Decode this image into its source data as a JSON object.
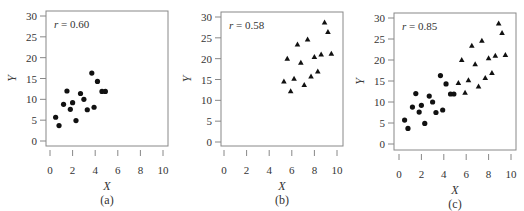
{
  "chart_data": [
    {
      "type": "scatter",
      "panel": "(a)",
      "annotation": "r = 0.60",
      "xlabel": "X",
      "ylabel": "Y",
      "xlim": [
        0,
        10
      ],
      "ylim": [
        0,
        30
      ],
      "xticks": [
        0,
        2,
        4,
        6,
        8,
        10
      ],
      "yticks": [
        0,
        5,
        10,
        15,
        20,
        25,
        30
      ],
      "marker": "circle",
      "points": [
        [
          0.5,
          5.7
        ],
        [
          0.8,
          3.7
        ],
        [
          1.2,
          8.8
        ],
        [
          1.5,
          12.0
        ],
        [
          1.8,
          7.6
        ],
        [
          2.0,
          9.2
        ],
        [
          2.3,
          4.9
        ],
        [
          2.7,
          11.4
        ],
        [
          3.0,
          10.0
        ],
        [
          3.3,
          7.5
        ],
        [
          3.7,
          16.3
        ],
        [
          3.9,
          8.1
        ],
        [
          4.2,
          14.3
        ],
        [
          4.6,
          11.9
        ],
        [
          4.9,
          11.9
        ]
      ]
    },
    {
      "type": "scatter",
      "panel": "(b)",
      "annotation": "r = 0.58",
      "xlabel": "X",
      "ylabel": "Y",
      "xlim": [
        0,
        10
      ],
      "ylim": [
        0,
        30
      ],
      "xticks": [
        0,
        2,
        4,
        6,
        8,
        10
      ],
      "yticks": [
        0,
        5,
        10,
        15,
        20,
        25,
        30
      ],
      "marker": "triangle",
      "points": [
        [
          5.3,
          14.5
        ],
        [
          5.6,
          20.0
        ],
        [
          5.9,
          12.2
        ],
        [
          6.2,
          15.2
        ],
        [
          6.5,
          23.4
        ],
        [
          6.8,
          19.0
        ],
        [
          7.1,
          13.7
        ],
        [
          7.4,
          24.6
        ],
        [
          7.7,
          15.7
        ],
        [
          8.0,
          20.4
        ],
        [
          8.3,
          16.9
        ],
        [
          8.6,
          21.0
        ],
        [
          8.9,
          28.7
        ],
        [
          9.2,
          26.4
        ],
        [
          9.5,
          21.2
        ]
      ]
    },
    {
      "type": "scatter",
      "panel": "(c)",
      "annotation": "r = 0.85",
      "xlabel": "X",
      "ylabel": "Y",
      "xlim": [
        0,
        10
      ],
      "ylim": [
        0,
        30
      ],
      "xticks": [
        0,
        2,
        4,
        6,
        8,
        10
      ],
      "yticks": [
        0,
        5,
        10,
        15,
        20,
        25,
        30
      ],
      "series": [
        {
          "name": "circles (a)",
          "marker": "circle",
          "points": [
            [
              0.5,
              5.7
            ],
            [
              0.8,
              3.7
            ],
            [
              1.2,
              8.8
            ],
            [
              1.5,
              12.0
            ],
            [
              1.8,
              7.6
            ],
            [
              2.0,
              9.2
            ],
            [
              2.3,
              4.9
            ],
            [
              2.7,
              11.4
            ],
            [
              3.0,
              10.0
            ],
            [
              3.3,
              7.5
            ],
            [
              3.7,
              16.3
            ],
            [
              3.9,
              8.1
            ],
            [
              4.2,
              14.3
            ],
            [
              4.6,
              11.9
            ],
            [
              4.9,
              11.9
            ]
          ]
        },
        {
          "name": "triangles (b)",
          "marker": "triangle",
          "points": [
            [
              5.3,
              14.5
            ],
            [
              5.6,
              20.0
            ],
            [
              5.9,
              12.2
            ],
            [
              6.2,
              15.2
            ],
            [
              6.5,
              23.4
            ],
            [
              6.8,
              19.0
            ],
            [
              7.1,
              13.7
            ],
            [
              7.4,
              24.6
            ],
            [
              7.7,
              15.7
            ],
            [
              8.0,
              20.4
            ],
            [
              8.3,
              16.9
            ],
            [
              8.6,
              21.0
            ],
            [
              8.9,
              28.7
            ],
            [
              9.2,
              26.4
            ],
            [
              9.5,
              21.2
            ]
          ]
        }
      ]
    }
  ],
  "layout": {
    "panels": [
      {
        "box": [
          46,
          11,
          168,
          146
        ],
        "x0": 50,
        "x10": 163,
        "y0": 141,
        "y30": 16
      },
      {
        "box": [
          221,
          12,
          343,
          146
        ],
        "x0": 224,
        "x10": 337,
        "y0": 142,
        "y30": 17
      },
      {
        "box": [
          394,
          13,
          516,
          150
        ],
        "x0": 399,
        "x10": 511,
        "y0": 144,
        "y30": 18
      }
    ],
    "colors": {
      "axis": "#888888",
      "marker": "#111111",
      "text": "#333333"
    }
  }
}
